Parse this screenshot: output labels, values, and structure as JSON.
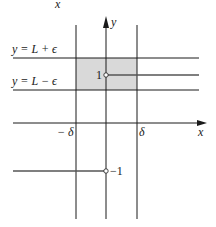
{
  "diagram": {
    "top_fragment": "x",
    "axes": {
      "x_label": "x",
      "y_label": "y"
    },
    "bands": {
      "upper_label": "y = L + ϵ",
      "lower_label": "y = L − ϵ"
    },
    "ticks": {
      "neg_delta": "− δ",
      "pos_delta": "δ"
    },
    "points": {
      "upper_value": "1",
      "lower_value": "−1"
    },
    "colors": {
      "shade": "#d9d9d9",
      "line": "#1a1a1a",
      "graph": "#555555"
    }
  }
}
